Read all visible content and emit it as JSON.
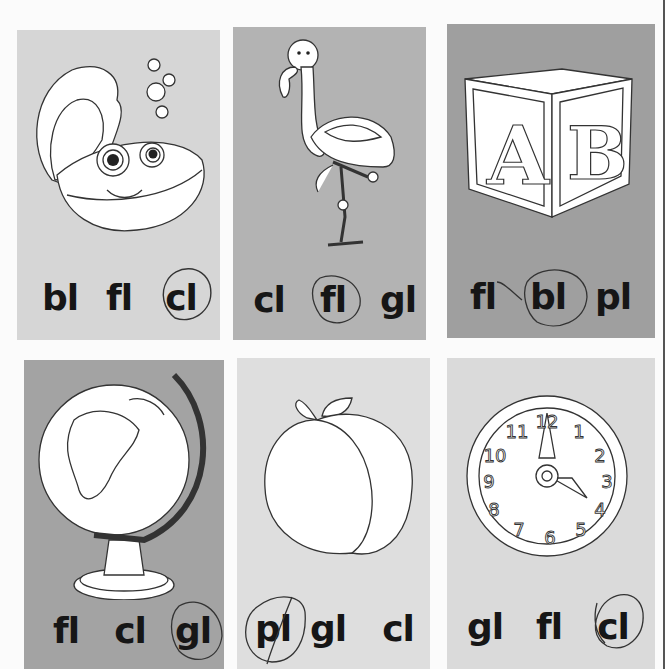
{
  "worksheet": {
    "title": "Beginning blends picture cards",
    "cards": [
      {
        "picture": "clam",
        "bg": "#d6d6d6",
        "choices": [
          "bl",
          "fl",
          "cl"
        ],
        "circled": "cl"
      },
      {
        "picture": "flamingo",
        "bg": "#b3b3b3",
        "choices": [
          "cl",
          "fl",
          "gl"
        ],
        "circled": "fl"
      },
      {
        "picture": "block",
        "bg": "#9f9f9f",
        "choices": [
          "fl",
          "bl",
          "pl"
        ],
        "circled": "bl"
      },
      {
        "picture": "globe",
        "bg": "#a3a3a3",
        "choices": [
          "fl",
          "cl",
          "gl"
        ],
        "circled": "gl"
      },
      {
        "picture": "plum",
        "bg": "#dedede",
        "choices": [
          "pl",
          "gl",
          "cl"
        ],
        "circled": "pl"
      },
      {
        "picture": "clock",
        "bg": "#dadada",
        "choices": [
          "gl",
          "fl",
          "cl"
        ],
        "circled": "cl"
      }
    ],
    "clock_numbers": [
      "12",
      "1",
      "2",
      "3",
      "4",
      "5",
      "6",
      "7",
      "8",
      "9",
      "10",
      "11"
    ],
    "block_letters": [
      "A",
      "B"
    ]
  }
}
